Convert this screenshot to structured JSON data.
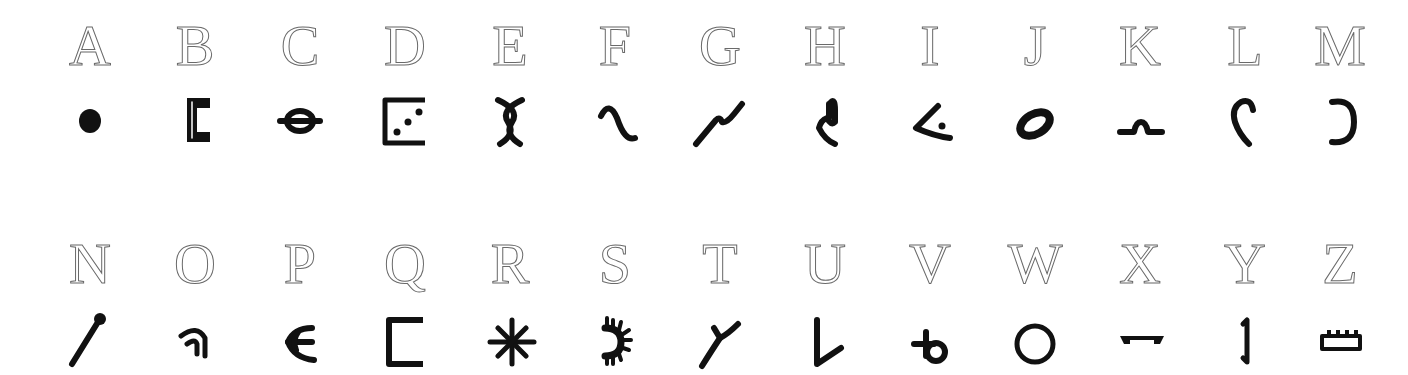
{
  "rows": [
    {
      "cells": [
        {
          "letter": "A",
          "symbol": "filled-dot"
        },
        {
          "letter": "B",
          "symbol": "thick-bracket-open-right"
        },
        {
          "letter": "C",
          "symbol": "circle-with-horizontal-bar"
        },
        {
          "letter": "D",
          "symbol": "bracket-with-three-dots"
        },
        {
          "letter": "E",
          "symbol": "crossed-curves"
        },
        {
          "letter": "F",
          "symbol": "tilde-wave"
        },
        {
          "letter": "G",
          "symbol": "rising-zigzag"
        },
        {
          "letter": "H",
          "symbol": "squiggle-hook"
        },
        {
          "letter": "I",
          "symbol": "less-than-with-dot"
        },
        {
          "letter": "J",
          "symbol": "tilted-thick-ring"
        },
        {
          "letter": "K",
          "symbol": "line-with-bump"
        },
        {
          "letter": "L",
          "symbol": "hook-curve"
        },
        {
          "letter": "M",
          "symbol": "reversed-c"
        }
      ]
    },
    {
      "cells": [
        {
          "letter": "N",
          "symbol": "match-stick"
        },
        {
          "letter": "O",
          "symbol": "double-arch"
        },
        {
          "letter": "P",
          "symbol": "forked-e"
        },
        {
          "letter": "Q",
          "symbol": "open-square-bracket"
        },
        {
          "letter": "R",
          "symbol": "eight-point-star"
        },
        {
          "letter": "S",
          "symbol": "half-sun"
        },
        {
          "letter": "T",
          "symbol": "y-branch"
        },
        {
          "letter": "U",
          "symbol": "tilted-v"
        },
        {
          "letter": "V",
          "symbol": "crossed-loop"
        },
        {
          "letter": "W",
          "symbol": "open-circle"
        },
        {
          "letter": "X",
          "symbol": "flat-staple"
        },
        {
          "letter": "Y",
          "symbol": "vertical-staple"
        },
        {
          "letter": "Z",
          "symbol": "crenellated-bar"
        }
      ]
    }
  ]
}
